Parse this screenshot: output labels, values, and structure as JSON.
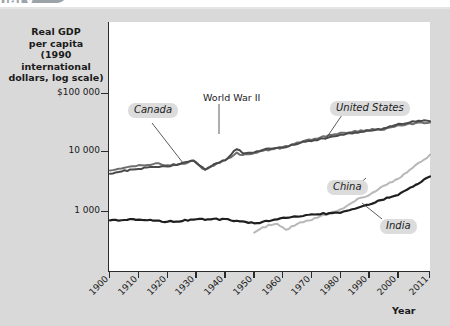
{
  "header": {
    "title_fragment": "nary"
  },
  "axes": {
    "y_title_lines": [
      "Real GDP",
      "per capita",
      "(1990 international",
      "dollars, log scale)"
    ],
    "y_ticks": [
      {
        "label": "$100 000",
        "value": 100000,
        "y": 93
      },
      {
        "label": "10 000",
        "value": 10000,
        "y": 151
      },
      {
        "label": "1 000",
        "value": 1000,
        "y": 211
      }
    ],
    "x_title": "Year",
    "x_ticks": [
      "1900",
      "1910",
      "1920",
      "1930",
      "1940",
      "1950",
      "1960",
      "1970",
      "1980",
      "1990",
      "2000",
      "2011"
    ]
  },
  "annotations": [
    {
      "name": "canada-label",
      "text": "Canada",
      "style": "pill",
      "x": 128,
      "y": 103
    },
    {
      "name": "world-war-ii-label",
      "text": "World War II",
      "style": "plain",
      "x": 203,
      "y": 92
    },
    {
      "name": "united-states-label",
      "text": "United States",
      "style": "pill",
      "x": 330,
      "y": 101
    },
    {
      "name": "china-label",
      "text": "China",
      "style": "pill",
      "x": 327,
      "y": 180
    },
    {
      "name": "india-label",
      "text": "India",
      "style": "pill",
      "x": 380,
      "y": 219
    }
  ],
  "colors": {
    "page_background": "#d9d9d9",
    "plot_background": "#ffffff",
    "axis": "#2b2b2b",
    "pill_background": "#dcdcdc",
    "series_dark": "#1f1f1f",
    "series_mid": "#6e6e6e",
    "series_light": "#b8b8b8",
    "header_pill": "#9aa3a8"
  },
  "chart_data": {
    "type": "line",
    "title": "",
    "xlabel": "Year",
    "ylabel": "Real GDP per capita (1990 international dollars, log scale)",
    "y_scale": "log",
    "ylim": [
      500,
      200000
    ],
    "xlim": [
      1900,
      2011
    ],
    "grid": false,
    "legend": "inline-callouts",
    "y_tick_values": [
      1000,
      10000,
      100000
    ],
    "y_tick_labels": [
      "1 000",
      "10 000",
      "$100 000"
    ],
    "x_tick_values": [
      1900,
      1910,
      1920,
      1930,
      1940,
      1950,
      1960,
      1970,
      1980,
      1990,
      2000,
      2011
    ],
    "annotations": [
      {
        "text": "World War II",
        "x": 1944,
        "note": "spike in United States real GDP per capita"
      }
    ],
    "series": [
      {
        "name": "Canada",
        "color": "#6e6e6e",
        "x": [
          1900,
          1905,
          1910,
          1913,
          1917,
          1920,
          1925,
          1929,
          1933,
          1937,
          1940,
          1944,
          1946,
          1950,
          1955,
          1960,
          1965,
          1970,
          1975,
          1980,
          1985,
          1990,
          1995,
          2000,
          2005,
          2011
        ],
        "values": [
          4600,
          5200,
          5800,
          5900,
          6200,
          5700,
          6100,
          6900,
          4800,
          6200,
          7000,
          9200,
          8600,
          9200,
          10500,
          11400,
          13600,
          15700,
          17800,
          19800,
          21200,
          22500,
          23000,
          26200,
          28500,
          30000
        ]
      },
      {
        "name": "United States",
        "color": "#4a4a4a",
        "x": [
          1900,
          1905,
          1910,
          1913,
          1917,
          1920,
          1925,
          1929,
          1933,
          1937,
          1940,
          1944,
          1946,
          1950,
          1955,
          1960,
          1965,
          1970,
          1975,
          1980,
          1985,
          1990,
          1995,
          2000,
          2005,
          2011
        ],
        "values": [
          4100,
          4700,
          5000,
          5300,
          5500,
          5600,
          6300,
          6900,
          4800,
          6400,
          7000,
          11000,
          9200,
          9600,
          10900,
          11300,
          13400,
          15000,
          16300,
          18600,
          20000,
          22000,
          23400,
          28000,
          31000,
          32000
        ]
      },
      {
        "name": "China",
        "color": "#b8b8b8",
        "x": [
          1950,
          1955,
          1958,
          1961,
          1965,
          1970,
          1975,
          1980,
          1985,
          1990,
          1995,
          2000,
          2005,
          2008,
          2011
        ],
        "values": [
          450,
          580,
          620,
          480,
          620,
          720,
          880,
          1060,
          1500,
          1860,
          2650,
          3400,
          5300,
          6800,
          8500
        ]
      },
      {
        "name": "India",
        "color": "#1f1f1f",
        "x": [
          1900,
          1910,
          1920,
          1930,
          1940,
          1950,
          1960,
          1970,
          1980,
          1990,
          2000,
          2005,
          2011
        ],
        "values": [
          700,
          730,
          660,
          720,
          730,
          620,
          760,
          870,
          950,
          1300,
          1900,
          2500,
          3800
        ]
      }
    ]
  }
}
